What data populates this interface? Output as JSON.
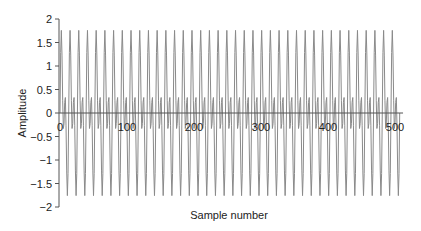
{
  "chart_data": {
    "type": "line",
    "title": "",
    "xlabel": "Sample number",
    "ylabel": "Amplitude",
    "xlim": [
      0,
      512
    ],
    "ylim": [
      -2,
      2
    ],
    "x_ticks": [
      0,
      100,
      200,
      300,
      400,
      500
    ],
    "x_tick_labels": [
      "0",
      "100",
      "200",
      "300",
      "400",
      "500"
    ],
    "y_ticks": [
      2,
      1.5,
      1,
      0.5,
      0,
      -0.5,
      -1,
      -1.5,
      -2
    ],
    "y_tick_labels": [
      "2",
      "1.5",
      "1",
      "0.5",
      "0",
      "−0.5",
      "−1",
      "−1.5",
      "−2"
    ],
    "grid": false,
    "legend": null,
    "series": [
      {
        "name": "signal",
        "description": "Sum of two sinusoids x[n] = sin(2πn/13) + sin(4πn/13), peaks approx ±1.75, secondary bumps approx ±0.35",
        "n_start": 0,
        "n_end": 507,
        "period_samples": 13,
        "components": [
          {
            "amplitude": 1.0,
            "harmonic": 1
          },
          {
            "amplitude": 1.0,
            "harmonic": 2
          }
        ],
        "approx_max": 1.75,
        "approx_min": -1.75,
        "color": "#8a8a8a"
      }
    ],
    "axis_color": "#555555"
  }
}
